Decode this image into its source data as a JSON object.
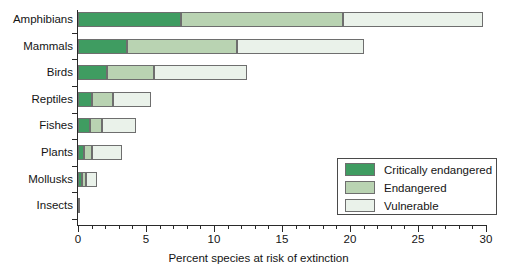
{
  "chart_data": {
    "type": "bar",
    "orientation": "horizontal",
    "stacked": true,
    "title": "",
    "xlabel": "Percent species at risk of extinction",
    "ylabel": "",
    "xlim": [
      0,
      30
    ],
    "xticks": [
      0,
      5,
      10,
      15,
      20,
      25,
      30
    ],
    "xtick_labels": [
      "0",
      "5",
      "10",
      "15",
      "20",
      "25",
      "30"
    ],
    "minor_tick_interval": 1,
    "grid": false,
    "legend_position": "lower right",
    "categories": [
      "Amphibians",
      "Mammals",
      "Birds",
      "Reptiles",
      "Fishes",
      "Plants",
      "Mollusks",
      "Insects"
    ],
    "series": [
      {
        "name": "Critically endangered",
        "color": "#3f9c61",
        "values": [
          7.6,
          3.6,
          2.1,
          1.0,
          0.9,
          0.45,
          0.3,
          0.1
        ]
      },
      {
        "name": "Endangered",
        "color": "#b9d3b2",
        "values": [
          11.9,
          8.1,
          3.5,
          1.6,
          0.9,
          0.55,
          0.3,
          0.0
        ]
      },
      {
        "name": "Vulnerable",
        "color": "#eaf2ea",
        "values": [
          10.3,
          9.3,
          6.8,
          2.8,
          2.5,
          2.2,
          0.8,
          0.0
        ]
      }
    ],
    "totals": [
      29.8,
      21.0,
      12.4,
      5.4,
      4.3,
      3.2,
      1.4,
      0.1
    ]
  },
  "legend": {
    "items": [
      {
        "label": "Critically endangered",
        "color": "#3f9c61"
      },
      {
        "label": "Endangered",
        "color": "#b9d3b2"
      },
      {
        "label": "Vulnerable",
        "color": "#eaf2ea"
      }
    ]
  },
  "axis": {
    "x_title": "Percent species at risk of extinction"
  }
}
